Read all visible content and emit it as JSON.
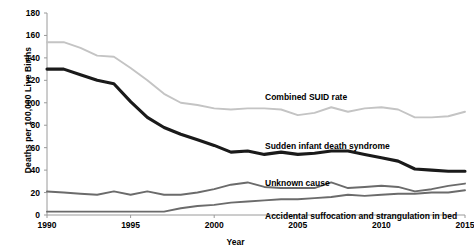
{
  "chart_data": {
    "type": "line",
    "title": "",
    "xlabel": "Year",
    "ylabel": "Deaths per 100,000 Live Births",
    "xlim": [
      1990,
      2015
    ],
    "ylim": [
      0,
      180
    ],
    "ytick_step": 20,
    "xtick_step": 5,
    "grid": false,
    "legend_position": "inline-annotations",
    "ytick_labels": [
      "0",
      "20",
      "40",
      "60",
      "80",
      "100",
      "120",
      "140",
      "160",
      "180"
    ],
    "ytick_values": [
      0,
      20,
      40,
      60,
      80,
      100,
      120,
      140,
      160,
      180
    ],
    "xtick_labels": [
      "1990",
      "1995",
      "2000",
      "2005",
      "2010",
      "2015"
    ],
    "xtick_values": [
      1990,
      1995,
      2000,
      2005,
      2010,
      2015
    ],
    "x": [
      1990,
      1991,
      1992,
      1993,
      1994,
      1995,
      1996,
      1997,
      1998,
      1999,
      2000,
      2001,
      2002,
      2003,
      2004,
      2005,
      2006,
      2007,
      2008,
      2009,
      2010,
      2011,
      2012,
      2013,
      2014,
      2015
    ],
    "series": [
      {
        "name": "Combined SUID rate",
        "color": "#c4c4c4",
        "label_x": 265,
        "label_y": 92,
        "values": [
          154,
          154,
          149,
          142,
          141,
          131,
          120,
          108,
          100,
          98,
          95,
          94,
          95,
          95,
          94,
          89,
          91,
          96,
          92,
          95,
          96,
          94,
          87,
          87,
          88,
          92
        ]
      },
      {
        "name": "Sudden infant death syndrome",
        "color": "#1a1a1a",
        "label_x": 265,
        "label_y": 141,
        "values": [
          130,
          130,
          125,
          120,
          117,
          101,
          87,
          78,
          72,
          67,
          62,
          56,
          57,
          54,
          56,
          54,
          55,
          57,
          57,
          54,
          51,
          48,
          41,
          40,
          39,
          39
        ]
      },
      {
        "name": "Unknown cause",
        "color": "#6b6b6b",
        "label_x": 265,
        "label_y": 178,
        "values": [
          21,
          20,
          19,
          18,
          21,
          18,
          21,
          18,
          18,
          20,
          23,
          27,
          29,
          25,
          24,
          24,
          24,
          29,
          24,
          25,
          26,
          25,
          21,
          23,
          26,
          28
        ]
      },
      {
        "name": "Accidental suffocation and strangulation in bed",
        "color": "#6b6b6b",
        "label_x": 265,
        "label_y": 211,
        "values": [
          3,
          3,
          3,
          3,
          3,
          3,
          3,
          3,
          6,
          8,
          9,
          11,
          12,
          13,
          14,
          14,
          15,
          16,
          18,
          17,
          18,
          19,
          19,
          20,
          20,
          22
        ]
      }
    ]
  }
}
